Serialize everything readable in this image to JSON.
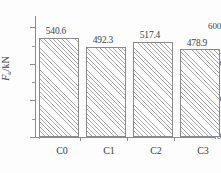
{
  "chart_data": {
    "type": "bar",
    "title": "",
    "xlabel": "",
    "ylabel": "Fu/kN",
    "ylabel_parts": {
      "symbol": "F",
      "subscript": "u",
      "unit": "/kN"
    },
    "categories": [
      "C0",
      "C1",
      "C2",
      "C3"
    ],
    "values": [
      540.6,
      492.3,
      517.4,
      478.9
    ],
    "value_labels": [
      "540.6",
      "492.3",
      "517.4",
      "478.9"
    ],
    "ylim": [
      0,
      660
    ],
    "ytick_labels": [
      "0",
      "200",
      "400",
      "600"
    ],
    "ytick_values": [
      0,
      200,
      400,
      600
    ],
    "yminor_values": [
      100,
      300,
      500
    ],
    "grid": false,
    "legend": null,
    "bar_style": {
      "fill": "#ffffff",
      "hatch": "/",
      "hatch_color": "#a9a9a9",
      "edge_color": "#8a8a8a"
    },
    "axis_color": "#8c8c8c",
    "text_color": "#3f3f3f"
  }
}
